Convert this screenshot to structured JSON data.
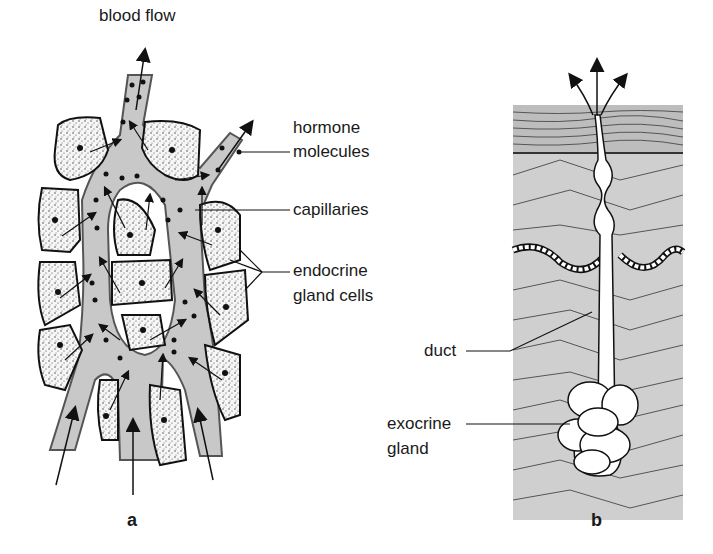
{
  "figure": {
    "panels": [
      {
        "id": "a",
        "letter": "a",
        "title": "endocrine gland",
        "labels": {
          "blood_flow": "blood flow",
          "hormone_molecules_1": "hormone",
          "hormone_molecules_2": "molecules",
          "capillaries": "capillaries",
          "endocrine_1": "endocrine",
          "endocrine_2": "gland cells"
        }
      },
      {
        "id": "b",
        "letter": "b",
        "title": "exocrine gland",
        "labels": {
          "duct": "duct",
          "exocrine_1": "exocrine",
          "exocrine_2": "gland"
        }
      }
    ],
    "colors": {
      "capillary_fill": "#c8c8c8",
      "tissue_fill": "#cfcfcf",
      "outline": "#1a1a1a",
      "cell_fill": "#f4f4f4"
    }
  }
}
